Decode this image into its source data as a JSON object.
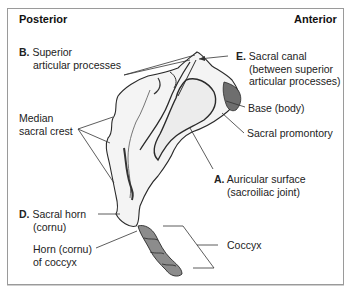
{
  "header": {
    "left": "Posterior",
    "right": "Anterior"
  },
  "labels": {
    "superior_articular": {
      "letter": "B.",
      "line1": "Superior",
      "line2": "articular processes"
    },
    "sacral_canal": {
      "letter": "E.",
      "line1": "Sacral canal",
      "line2": "(between superior",
      "line3": "articular processes)"
    },
    "base": {
      "text": "Base (body)"
    },
    "promontory": {
      "text": "Sacral promontory"
    },
    "median_crest": {
      "line1": "Median",
      "line2": "sacral crest"
    },
    "auricular": {
      "letter": "A.",
      "line1": "Auricular surface",
      "line2": "(sacroiliac joint)"
    },
    "sacral_horn": {
      "letter": "D.",
      "line1": "Sacral horn",
      "line2": "(cornu)"
    },
    "coccyx_horn": {
      "line1": "Horn (cornu)",
      "line2": "of coccyx"
    },
    "coccyx": {
      "text": "Coccyx"
    }
  },
  "colors": {
    "border": "#9a9a9a",
    "bone_outline": "#2a2a2a",
    "bone_fill": "#f4f4f4",
    "coccyx_fill": "#8c8c8c",
    "leader": "#333333"
  }
}
